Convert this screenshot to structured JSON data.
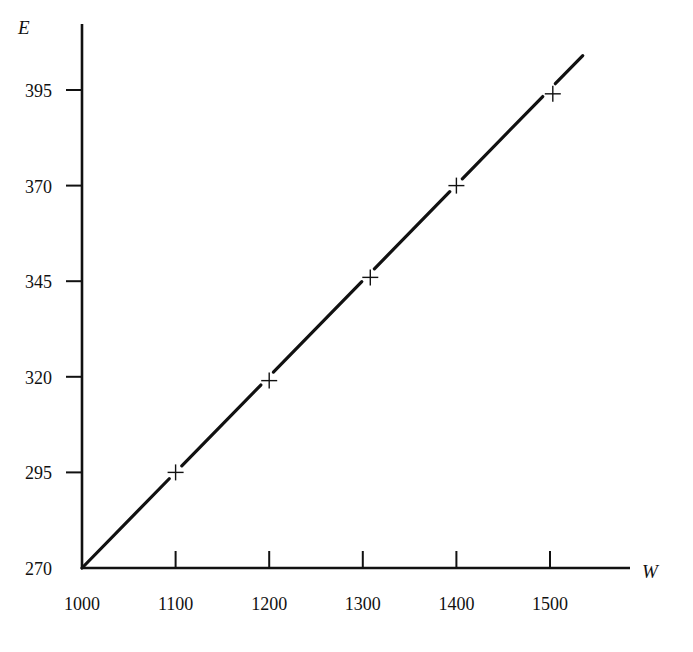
{
  "chart_data": {
    "type": "line",
    "title": "",
    "xlabel": "W",
    "ylabel": "E",
    "xlim": [
      1000,
      1550
    ],
    "ylim": [
      270,
      405
    ],
    "grid": false,
    "legend": null,
    "x_ticks": [
      "1000",
      "1100",
      "1200",
      "1300",
      "1400",
      "1500"
    ],
    "y_ticks": [
      "270",
      "295",
      "320",
      "345",
      "370",
      "395"
    ],
    "series": [
      {
        "name": "fitted line",
        "style": "solid line",
        "x": [
          1000,
          1535
        ],
        "y": [
          270,
          404
        ]
      },
      {
        "name": "data points",
        "style": "plus markers",
        "x": [
          1100,
          1200,
          1308,
          1400,
          1503
        ],
        "y": [
          295,
          319,
          346,
          370,
          394
        ]
      }
    ],
    "colors": {
      "line": "#111111",
      "axes": "#111111",
      "background": "#ffffff"
    }
  }
}
